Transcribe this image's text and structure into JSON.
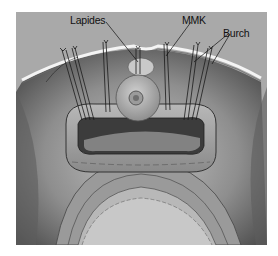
{
  "figure": {
    "labels": [
      {
        "id": "lapides",
        "text": "Lapides",
        "x": 70,
        "y": 14
      },
      {
        "id": "mmk",
        "text": "MMK",
        "x": 182,
        "y": 14
      },
      {
        "id": "burch",
        "text": "Burch",
        "x": 223,
        "y": 27
      }
    ],
    "colors": {
      "background": "#a9a9a9",
      "tissue_dark": "#5a5a5a",
      "tissue_mid": "#8c8c8c",
      "tissue_light": "#bdbdbd",
      "pubic_rim": "#f2f2f2",
      "suture": "#1a1a1a"
    }
  }
}
